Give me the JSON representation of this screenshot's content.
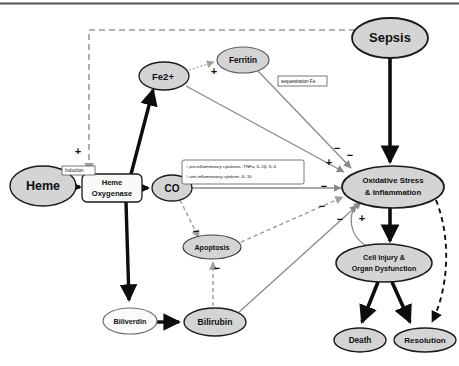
{
  "figure": {
    "type": "pathway-diagram",
    "background": "#ffffff",
    "top_rule": true
  },
  "colors": {
    "node_fill_gray": "#d4d4d4",
    "node_fill_white": "#fafafa",
    "node_stroke": "#1a1a1a",
    "arrow_black": "#0d0d0d",
    "arrow_gray": "#8a8a8a",
    "dashed_gray": "#9a9a9a",
    "text": "#101010"
  },
  "nodes": [
    {
      "id": "heme",
      "label": "Heme",
      "shape": "ellipse",
      "fill": "gray",
      "cx": 43,
      "cy": 186,
      "rx": 33,
      "ry": 20,
      "font_size": 12.5,
      "lines": [
        "Heme"
      ]
    },
    {
      "id": "ho",
      "label": "Heme Oxygenase",
      "shape": "roundrect",
      "fill": "white",
      "cx": 112,
      "cy": 188,
      "w": 60,
      "h": 28,
      "font_size": 7.6,
      "lines": [
        "Heme",
        "Oxygenase"
      ]
    },
    {
      "id": "fe2",
      "label": "Fe2+",
      "shape": "ellipse",
      "fill": "gray",
      "cx": 164,
      "cy": 76,
      "rx": 25,
      "ry": 14,
      "font_size": 9.5,
      "lines": [
        "Fe2+"
      ]
    },
    {
      "id": "ferritin",
      "label": "Ferritin",
      "shape": "ellipse",
      "fill": "gray",
      "cx": 243,
      "cy": 60,
      "rx": 26,
      "ry": 13,
      "font_size": 8.2,
      "lines": [
        "Ferritin"
      ]
    },
    {
      "id": "co",
      "label": "CO",
      "shape": "ellipse",
      "fill": "gray",
      "cx": 172,
      "cy": 188,
      "rx": 20,
      "ry": 13,
      "font_size": 10,
      "lines": [
        "CO"
      ]
    },
    {
      "id": "apoptosis",
      "label": "Apoptosis",
      "shape": "ellipse",
      "fill": "gray",
      "cx": 212,
      "cy": 247,
      "rx": 29,
      "ry": 12,
      "font_size": 7.2,
      "lines": [
        "Apoptosis"
      ]
    },
    {
      "id": "biliverdin",
      "label": "Biliverdin",
      "shape": "ellipse",
      "fill": "white",
      "cx": 130,
      "cy": 321,
      "rx": 27,
      "ry": 13,
      "font_size": 7.2,
      "lines": [
        "Biliverdin"
      ]
    },
    {
      "id": "bilirubin",
      "label": "Bilirubin",
      "shape": "ellipse",
      "fill": "gray",
      "cx": 215,
      "cy": 322,
      "rx": 31,
      "ry": 14,
      "font_size": 8.6,
      "lines": [
        "Bilirubin"
      ]
    },
    {
      "id": "sepsis",
      "label": "Sepsis",
      "shape": "ellipse",
      "fill": "gray",
      "cx": 390,
      "cy": 38,
      "rx": 38,
      "ry": 20,
      "font_size": 13,
      "lines": [
        "Sepsis"
      ]
    },
    {
      "id": "oxstress",
      "label": "Oxidative Stress & Inflammation",
      "shape": "ellipse",
      "fill": "gray",
      "cx": 393,
      "cy": 187,
      "rx": 51,
      "ry": 21,
      "font_size": 7.8,
      "lines": [
        "Oxidative Stress",
        "& Inflammation"
      ]
    },
    {
      "id": "cellinjury",
      "label": "Cell Injury & Organ Dysfunction",
      "shape": "ellipse",
      "fill": "gray",
      "cx": 384,
      "cy": 263,
      "rx": 48,
      "ry": 19,
      "font_size": 7.2,
      "lines": [
        "Cell Injury &",
        "Organ Dysfunction"
      ]
    },
    {
      "id": "death",
      "label": "Death",
      "shape": "ellipse",
      "fill": "gray",
      "cx": 360,
      "cy": 340,
      "rx": 26,
      "ry": 12,
      "font_size": 8.2,
      "lines": [
        "Death"
      ]
    },
    {
      "id": "resolution",
      "label": "Resolution",
      "shape": "ellipse",
      "fill": "gray",
      "cx": 425,
      "cy": 340,
      "rx": 31,
      "ry": 12,
      "font_size": 8,
      "lines": [
        "Resolution"
      ]
    }
  ],
  "annotation_boxes": [
    {
      "id": "induction",
      "label": "Induction",
      "x": 62,
      "y": 166,
      "w": 33,
      "h": 9,
      "font_size": 4.6,
      "lines": [
        "Induction"
      ]
    },
    {
      "id": "sequestration",
      "label": "sequestration Fe",
      "x": 278,
      "y": 76,
      "w": 49,
      "h": 10,
      "font_size": 4.6,
      "lines": [
        "sequestration Fe"
      ]
    },
    {
      "id": "cytokines",
      "label": "cytokine effects",
      "x": 182,
      "y": 160,
      "w": 122,
      "h": 24,
      "font_size": 4.3,
      "lines": [
        "↓ pro-inflammatory cytokines -TNFα, IL-1β, IL-6",
        "↑ anti-inflammatory cytokine -IL-10"
      ]
    }
  ],
  "signs": [
    {
      "id": "sign-induction",
      "text": "+",
      "x": 78,
      "y": 152
    },
    {
      "id": "sign-ferritin",
      "text": "+",
      "x": 214,
      "y": 72
    },
    {
      "id": "sign-fe2-ox",
      "text": "+",
      "x": 329,
      "y": 163
    },
    {
      "id": "sign-ferritin-ox",
      "text": "−",
      "x": 337,
      "y": 149
    },
    {
      "id": "sign-co-ox",
      "text": "−",
      "x": 324,
      "y": 187
    },
    {
      "id": "sign-apop-ox",
      "text": "−",
      "x": 322,
      "y": 207
    },
    {
      "id": "sign-bili-ox",
      "text": "−",
      "x": 340,
      "y": 220
    },
    {
      "id": "sign-sepsis-ho",
      "text": "−",
      "x": 345,
      "y": 205
    },
    {
      "id": "sign-feedback",
      "text": "+",
      "x": 362,
      "y": 219
    },
    {
      "id": "sign-co-apop",
      "text": "−",
      "x": 196,
      "y": 232
    },
    {
      "id": "sign-apop-bili",
      "text": "−",
      "x": 217,
      "y": 269
    },
    {
      "id": "sign-sepsis-side",
      "text": "−",
      "x": 350,
      "y": 156
    }
  ],
  "edges": [
    {
      "id": "heme-to-ho",
      "from": "heme",
      "to": "ho",
      "style": "solid-black-thin",
      "label": ""
    },
    {
      "id": "ho-to-fe2",
      "from": "ho",
      "to": "fe2",
      "style": "solid-black-thick",
      "label": ""
    },
    {
      "id": "ho-to-co",
      "from": "ho",
      "to": "co",
      "style": "solid-black-thick",
      "label": ""
    },
    {
      "id": "ho-to-biliverdin",
      "from": "ho",
      "to": "biliverdin",
      "style": "solid-black-thick",
      "label": ""
    },
    {
      "id": "biliverdin-to-bilirubin",
      "from": "biliverdin",
      "to": "bilirubin",
      "style": "solid-black-thick",
      "label": ""
    },
    {
      "id": "fe2-to-ferritin",
      "from": "fe2",
      "to": "ferritin",
      "style": "dotted-gray",
      "label": "+"
    },
    {
      "id": "fe2-to-oxstress",
      "from": "fe2",
      "to": "oxstress",
      "style": "solid-gray",
      "label": "+"
    },
    {
      "id": "ferritin-to-oxstress",
      "from": "ferritin",
      "to": "oxstress",
      "style": "solid-gray",
      "label": "−"
    },
    {
      "id": "co-to-oxstress",
      "from": "co",
      "to": "oxstress",
      "style": "solid-gray",
      "label": "−"
    },
    {
      "id": "co-to-apoptosis",
      "from": "co",
      "to": "apoptosis",
      "style": "dashed-gray",
      "label": "−"
    },
    {
      "id": "apoptosis-to-bilirubin",
      "from": "apoptosis",
      "to": "bilirubin",
      "style": "dashed-gray",
      "label": "−"
    },
    {
      "id": "apoptosis-to-oxstress",
      "from": "apoptosis",
      "to": "oxstress",
      "style": "dashed-gray",
      "label": "−"
    },
    {
      "id": "bilirubin-to-oxstress",
      "from": "bilirubin",
      "to": "oxstress",
      "style": "solid-gray",
      "label": "−"
    },
    {
      "id": "sepsis-to-oxstress",
      "from": "sepsis",
      "to": "oxstress",
      "style": "solid-black-thick",
      "label": ""
    },
    {
      "id": "sepsis-to-ho",
      "from": "sepsis",
      "to": "ho",
      "style": "dashed-gray",
      "label": "+"
    },
    {
      "id": "oxstress-to-cellinjury",
      "from": "oxstress",
      "to": "cellinjury",
      "style": "solid-black-thick",
      "label": ""
    },
    {
      "id": "cellinjury-feedback",
      "from": "cellinjury",
      "to": "oxstress",
      "style": "solid-gray-curve",
      "label": "+"
    },
    {
      "id": "cellinjury-to-death",
      "from": "cellinjury",
      "to": "death",
      "style": "solid-black-thick",
      "label": ""
    },
    {
      "id": "cellinjury-to-resolution",
      "from": "cellinjury",
      "to": "resolution",
      "style": "solid-black-thick",
      "label": ""
    },
    {
      "id": "oxstress-to-resolution",
      "from": "oxstress",
      "to": "resolution",
      "style": "dashed-black-curve",
      "label": ""
    }
  ]
}
